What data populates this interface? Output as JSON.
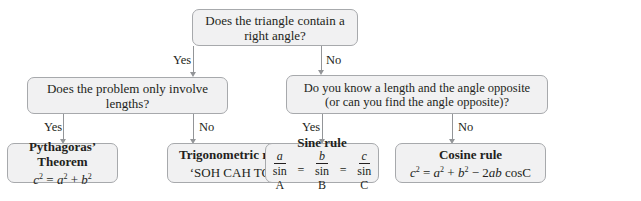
{
  "diagram": {
    "root": {
      "question": "Does the triangle contain a right angle?"
    },
    "branch_labels": {
      "yes": "Yes",
      "no": "No"
    },
    "left_question": "Does the problem only involve lengths?",
    "right_question_line1": "Do you know a length and the angle opposite",
    "right_question_line2": "(or can you find the angle opposite)?",
    "outcomes": {
      "pythagoras": {
        "title": "Pythagoras’ Theorem",
        "formula": {
          "c": "c",
          "eq": " = ",
          "a": "a",
          "plus": " + ",
          "b": "b",
          "exp": "2"
        }
      },
      "trig": {
        "title": "Trigonometric ratios",
        "subtitle": "‘SOH CAH TOA’"
      },
      "sine": {
        "title": "Sine rule",
        "num_a": "a",
        "den_a": "sin A",
        "num_b": "b",
        "den_b": "sin B",
        "num_c": "c",
        "den_c": "sin C",
        "eq": "="
      },
      "cosine": {
        "title": "Cosine rule",
        "formula": {
          "c": "c",
          "eq": " = ",
          "a": "a",
          "plus": " + ",
          "b": "b",
          "minus": " − 2",
          "ab": "ab",
          "cos": " cosC",
          "exp": "2"
        }
      }
    }
  }
}
